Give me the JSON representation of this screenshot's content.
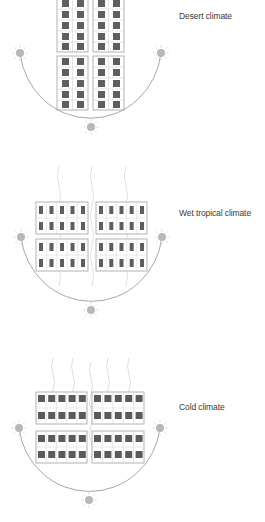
{
  "sections": [
    {
      "id": "desert",
      "label": "Desert climate",
      "building_layout": "tall narrow blocks",
      "blocks": "2x2",
      "windows_per_block": {
        "cols": 2,
        "rows": 5
      },
      "heat_lines": 0,
      "sun_positions": [
        "left-horizon",
        "right-horizon",
        "bottom"
      ]
    },
    {
      "id": "wet-tropical",
      "label": "Wet tropical climate",
      "building_layout": "wide blocks, small narrow windows",
      "blocks": "2x2",
      "windows_per_block": {
        "cols": 5,
        "rows": 2
      },
      "heat_lines": 3,
      "sun_positions": [
        "left-horizon",
        "right-horizon",
        "bottom"
      ]
    },
    {
      "id": "cold",
      "label": "Cold climate",
      "building_layout": "wide blocks, large square windows",
      "blocks": "2x2",
      "windows_per_block": {
        "cols": 5,
        "rows": 2
      },
      "heat_lines": 5,
      "sun_positions": [
        "left-horizon",
        "right-horizon",
        "bottom"
      ]
    }
  ],
  "colors": {
    "background": "#ffffff",
    "window_fill": "#5e5e5e",
    "block_outline": "#9a9a9a",
    "arc": "#a0a0a0",
    "sun": "#b5b5b5",
    "heat_line": "#d4d4d4",
    "label_text": "#3a3a3a"
  }
}
